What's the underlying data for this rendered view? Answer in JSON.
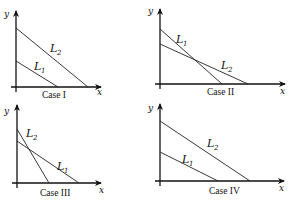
{
  "panels": [
    {
      "caption": "Case I",
      "x_label": "x",
      "y_label": "y",
      "lines": [
        {
          "name": "L",
          "sub": "2",
          "x1": 16,
          "y1": 28,
          "x2": 88,
          "y2": 87,
          "lx": 50,
          "ly": 52
        },
        {
          "name": "L",
          "sub": "1",
          "x1": 16,
          "y1": 61,
          "x2": 58,
          "y2": 87,
          "lx": 34,
          "ly": 70
        }
      ],
      "axis": {
        "ox": 16,
        "oy": 87,
        "top": 11,
        "right": 101
      },
      "caption_pos": [
        42,
        98
      ],
      "x_label_pos": [
        97,
        95
      ],
      "y_label_pos": [
        4,
        17
      ]
    },
    {
      "caption": "Case II",
      "x_label": "x",
      "y_label": "y",
      "lines": [
        {
          "name": "L",
          "sub": "1",
          "x1": 160,
          "y1": 29,
          "x2": 222,
          "y2": 84,
          "lx": 176,
          "ly": 43
        },
        {
          "name": "L",
          "sub": "2",
          "x1": 160,
          "y1": 44,
          "x2": 248,
          "y2": 84,
          "lx": 221,
          "ly": 69
        }
      ],
      "axis": {
        "ox": 160,
        "oy": 84,
        "top": 9,
        "right": 285
      },
      "caption_pos": [
        207,
        95
      ],
      "x_label_pos": [
        280,
        94
      ],
      "y_label_pos": [
        148,
        14
      ]
    },
    {
      "caption": "Case III",
      "x_label": "x",
      "y_label": "y",
      "lines": [
        {
          "name": "L",
          "sub": "2",
          "x1": 17,
          "y1": 129,
          "x2": 49,
          "y2": 183,
          "lx": 26,
          "ly": 137
        },
        {
          "name": "L",
          "sub": "1",
          "x1": 17,
          "y1": 141,
          "x2": 79,
          "y2": 183,
          "lx": 57,
          "ly": 170
        }
      ],
      "axis": {
        "ox": 17,
        "oy": 183,
        "top": 105,
        "right": 101
      },
      "caption_pos": [
        40,
        196
      ],
      "x_label_pos": [
        99,
        193
      ],
      "y_label_pos": [
        4,
        114
      ]
    },
    {
      "caption": "Case IV",
      "x_label": "x",
      "y_label": "y",
      "lines": [
        {
          "name": "L",
          "sub": "2",
          "x1": 160,
          "y1": 121,
          "x2": 250,
          "y2": 181,
          "lx": 207,
          "ly": 147
        },
        {
          "name": "L",
          "sub": "1",
          "x1": 160,
          "y1": 152,
          "x2": 218,
          "y2": 181,
          "lx": 182,
          "ly": 163
        }
      ],
      "axis": {
        "ox": 160,
        "oy": 181,
        "top": 104,
        "right": 284
      },
      "caption_pos": [
        209,
        194
      ],
      "x_label_pos": [
        279,
        191
      ],
      "y_label_pos": [
        148,
        111
      ]
    }
  ]
}
